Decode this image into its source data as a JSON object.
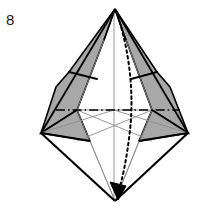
{
  "figure": {
    "step_number": "8",
    "canvas": {
      "width": 201,
      "height": 217
    },
    "colors": {
      "flap_fill": "#a8a8a8",
      "paper_fill": "#ffffff",
      "outline_stroke": "#000000",
      "crease_stroke": "#8c8c8c",
      "axis_stroke": "#000000",
      "motion_stroke": "#000000",
      "background": "#ffffff"
    },
    "vertices": {
      "apex_top": {
        "x": 115,
        "y": 9
      },
      "vertex_left": {
        "x": 41,
        "y": 133
      },
      "vertex_right": {
        "x": 188,
        "y": 133
      },
      "vertex_bottom": {
        "x": 115,
        "y": 201
      },
      "center": {
        "x": 114,
        "y": 110
      },
      "flap_left_outer_top": {
        "x": 69,
        "y": 72
      },
      "flap_left_outer_bottom": {
        "x": 56,
        "y": 87
      },
      "flap_right_outer_top": {
        "x": 157,
        "y": 72
      },
      "flap_right_outer_bottom": {
        "x": 170,
        "y": 87
      },
      "axis_left_end": {
        "x": 56,
        "y": 110
      },
      "axis_right_end": {
        "x": 180,
        "y": 110
      },
      "motion_peak": {
        "x": 133,
        "y": 112
      }
    },
    "elements": [
      {
        "name": "left-shaded-flap",
        "type": "polygon",
        "fill": "flap_fill"
      },
      {
        "name": "right-shaded-flap",
        "type": "polygon",
        "fill": "flap_fill"
      },
      {
        "name": "left-lower-shaded-triangle",
        "type": "polygon",
        "fill": "flap_fill"
      },
      {
        "name": "right-lower-shaded-triangle",
        "type": "polygon",
        "fill": "flap_fill"
      },
      {
        "name": "horizontal-axis-line",
        "type": "dash-dot-line"
      },
      {
        "name": "motion-arrow",
        "type": "dotted-curve-with-arrowhead"
      },
      {
        "name": "crease-lines",
        "type": "thin-gray-lines"
      },
      {
        "name": "outline",
        "type": "black-outline"
      }
    ],
    "annotations": {
      "axis_line_style": "dash-dot",
      "motion_arrow_style": "dotted curve with solid filled arrowhead",
      "arrow_direction": "apex-top to vertex-bottom"
    }
  }
}
